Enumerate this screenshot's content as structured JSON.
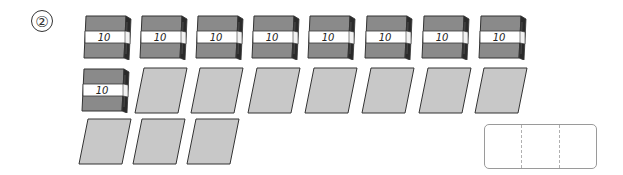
{
  "problem": {
    "number_label": "②"
  },
  "bundles": {
    "label": "10",
    "count": 9,
    "items": [
      {
        "label": "10",
        "x": 82,
        "y": 14
      },
      {
        "label": "10",
        "x": 138,
        "y": 14
      },
      {
        "label": "10",
        "x": 194,
        "y": 14
      },
      {
        "label": "10",
        "x": 250,
        "y": 14
      },
      {
        "label": "10",
        "x": 306,
        "y": 14
      },
      {
        "label": "10",
        "x": 363,
        "y": 14
      },
      {
        "label": "10",
        "x": 420,
        "y": 14
      },
      {
        "label": "10",
        "x": 477,
        "y": 14
      },
      {
        "label": "10",
        "x": 80,
        "y": 67
      }
    ]
  },
  "sheets": {
    "count": 10,
    "items": [
      {
        "x": 134,
        "y": 67
      },
      {
        "x": 190,
        "y": 67
      },
      {
        "x": 247,
        "y": 67
      },
      {
        "x": 304,
        "y": 67
      },
      {
        "x": 361,
        "y": 67
      },
      {
        "x": 418,
        "y": 67
      },
      {
        "x": 474,
        "y": 67
      },
      {
        "x": 78,
        "y": 118
      },
      {
        "x": 132,
        "y": 118
      },
      {
        "x": 186,
        "y": 118
      }
    ]
  },
  "answer_box": {
    "cells": 3,
    "values": [
      "",
      "",
      ""
    ]
  },
  "colors": {
    "bundle_fill": "#8a8a8a",
    "bundle_edge": "#2a2a2a",
    "band": "#ffffff",
    "sheet_fill": "#c8c8c8",
    "outline": "#333333"
  }
}
